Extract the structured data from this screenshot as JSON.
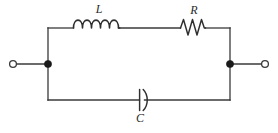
{
  "figure": {
    "kind": "circuit-schematic",
    "width": 278,
    "height": 133,
    "background_color": "#ffffff",
    "wire_color": "#3a3a3a",
    "component_color": "#2f2f2f",
    "node_color": "#1a1a1a",
    "label_color": "#2a2a2a"
  },
  "labels": {
    "inductor": "L",
    "resistor": "R",
    "capacitor": "C"
  },
  "components": {
    "inductor": {
      "name": "inductor",
      "label": "L",
      "symbol": "coil",
      "coil_count": 4.5,
      "branch": "top",
      "x_start": 73,
      "x_end": 120,
      "y": 28,
      "label_x": 99,
      "label_y": 13
    },
    "resistor": {
      "name": "resistor",
      "label": "R",
      "symbol": "zigzag",
      "peak_count": 3,
      "branch": "top",
      "x_start": 180,
      "x_end": 206,
      "y": 28,
      "label_x": 194,
      "label_y": 14
    },
    "capacitor": {
      "name": "capacitor",
      "label": "C",
      "symbol": "plate-and-curve",
      "branch": "bottom",
      "plate_x": 139.5,
      "curve_x": 143.5,
      "y": 100,
      "plate_height": 21,
      "label_x": 140,
      "label_y": 122
    }
  },
  "nodes": {
    "left_junction": {
      "name": "left-junction",
      "x": 48,
      "y": 64,
      "radius": 3.6
    },
    "right_junction": {
      "name": "right-junction",
      "x": 230,
      "y": 64,
      "radius": 3.6
    }
  },
  "terminals": {
    "left": {
      "name": "left-terminal",
      "x": 13,
      "y": 64,
      "radius": 3.4,
      "lead_to_x": 48
    },
    "right": {
      "name": "right-terminal",
      "x": 265,
      "y": 64,
      "radius": 3.4,
      "lead_to_x": 230
    }
  },
  "loop": {
    "left_x": 48,
    "right_x": 230,
    "top_y": 28,
    "bottom_y": 100
  }
}
